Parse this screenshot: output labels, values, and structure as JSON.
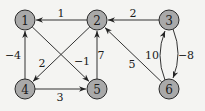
{
  "graph": {
    "type": "directed-weighted",
    "nodes": [
      {
        "id": "1",
        "label": "1",
        "x": 25,
        "y": 20
      },
      {
        "id": "2",
        "label": "2",
        "x": 97,
        "y": 20
      },
      {
        "id": "3",
        "label": "3",
        "x": 169,
        "y": 20
      },
      {
        "id": "4",
        "label": "4",
        "x": 25,
        "y": 89
      },
      {
        "id": "5",
        "label": "5",
        "x": 97,
        "y": 89
      },
      {
        "id": "6",
        "label": "6",
        "x": 169,
        "y": 89
      }
    ],
    "edges": [
      {
        "from": "2",
        "to": "1",
        "weight": "1",
        "lx": 61,
        "ly": 13
      },
      {
        "from": "3",
        "to": "2",
        "weight": "2",
        "lx": 133,
        "ly": 13
      },
      {
        "from": "4",
        "to": "1",
        "weight": "−4",
        "lx": 13,
        "ly": 55
      },
      {
        "from": "2",
        "to": "4",
        "weight": "2",
        "lx": 42,
        "ly": 63
      },
      {
        "from": "1",
        "to": "5",
        "weight": "−1",
        "lx": 82,
        "ly": 61
      },
      {
        "from": "5",
        "to": "2",
        "weight": "7",
        "lx": 101,
        "ly": 55
      },
      {
        "from": "4",
        "to": "5",
        "weight": "3",
        "lx": 60,
        "ly": 97
      },
      {
        "from": "6",
        "to": "2",
        "weight": "5",
        "lx": 132,
        "ly": 64
      },
      {
        "from": "6",
        "to": "3",
        "weight": "10",
        "lx": 152,
        "ly": 55
      },
      {
        "from": "3",
        "to": "6",
        "weight": "−8",
        "lx": 186,
        "ly": 55
      }
    ]
  }
}
